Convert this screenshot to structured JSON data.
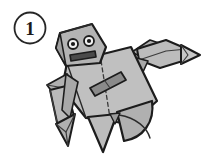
{
  "illustration": {
    "title": "Origami robot folding diagram",
    "subject": "robot",
    "background_color": "#ffffff",
    "step_badge": {
      "label": "1",
      "shape": "circle",
      "outline_color": "#262626",
      "fill_color": "#ffffff",
      "text_color": "#1a1a1a"
    },
    "palette": {
      "paper_light": "#c4c4c4",
      "paper_mid": "#b4b4b4",
      "paper_shade": "#a6a6a6",
      "paper_dark": "#8f8f8f",
      "detail_dark": "#6e6e6e",
      "outline": "#1c1c1c",
      "eye_white": "#f2f2f2",
      "eye_pupil": "#1a1a1a",
      "fold_line": "#3a3a3a"
    },
    "parts": [
      {
        "name": "head",
        "label": "Head",
        "fill": "#b4b4b4"
      },
      {
        "name": "left-eye",
        "label": "Left eye",
        "fill": "#f2f2f2"
      },
      {
        "name": "right-eye",
        "label": "Right eye",
        "fill": "#f2f2f2"
      },
      {
        "name": "mouth",
        "label": "Mouth bar",
        "fill": "#4a4a4a"
      },
      {
        "name": "torso",
        "label": "Torso",
        "fill": "#c0c0c0"
      },
      {
        "name": "belt",
        "label": "Belt detail",
        "fill": "#8a8a8a"
      },
      {
        "name": "center-fold",
        "label": "Center fold line",
        "fill": "none"
      },
      {
        "name": "right-arm",
        "label": "Right arm",
        "fill": "#b8b8b8"
      },
      {
        "name": "right-hand",
        "label": "Right hand point",
        "fill": "#c4c4c4"
      },
      {
        "name": "left-arm",
        "label": "Left arm",
        "fill": "#b8b8b8"
      },
      {
        "name": "left-hand",
        "label": "Left hand point",
        "fill": "#b0b0b0"
      },
      {
        "name": "left-leg",
        "label": "Left leg flap",
        "fill": "#bcbcbc"
      },
      {
        "name": "right-leg",
        "label": "Right leg flap",
        "fill": "#b0b0b0"
      }
    ]
  }
}
